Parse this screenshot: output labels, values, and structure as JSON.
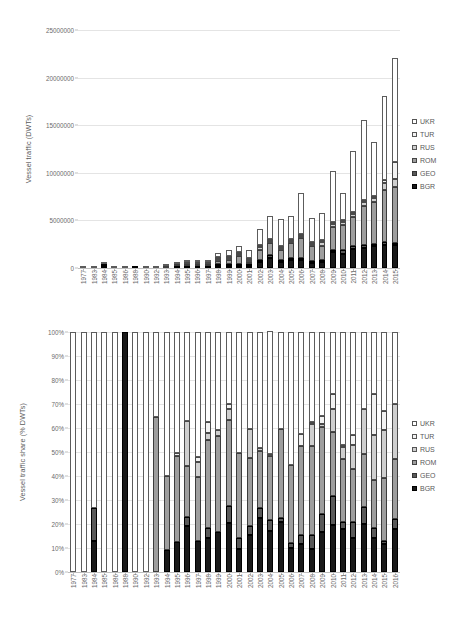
{
  "legend": {
    "position": "right",
    "entries": [
      {
        "key": "UKR",
        "label": "UKR",
        "swatch": "sw-ukr",
        "color": "#ffffff"
      },
      {
        "key": "TUR",
        "label": "TUR",
        "swatch": "sw-tur",
        "color": "#f2f2f2"
      },
      {
        "key": "RUS",
        "label": "RUS",
        "swatch": "sw-rus",
        "color": "#cfcfcf"
      },
      {
        "key": "ROM",
        "label": "ROM",
        "swatch": "sw-rom",
        "color": "#9e9e9e"
      },
      {
        "key": "GEO",
        "label": "GEO",
        "swatch": "sw-geo",
        "color": "#595959"
      },
      {
        "key": "BGR",
        "label": "BGR",
        "swatch": "sw-bgr",
        "color": "#1a1a1a"
      }
    ]
  },
  "chart_data": [
    {
      "id": "top",
      "type": "bar",
      "stacked": true,
      "title": "",
      "xlabel": "",
      "ylabel": "Vessel traffic (DWTs)",
      "ylim": [
        0,
        25000000
      ],
      "ytick_step": 5000000,
      "ytick_labels": [
        "0",
        "5000000",
        "10000000",
        "15000000",
        "20000000",
        "25000000"
      ],
      "grid": true,
      "legend_entries": [
        "UKR",
        "TUR",
        "RUS",
        "ROM",
        "GEO",
        "BGR"
      ],
      "categories": [
        "1977",
        "1983",
        "1984",
        "1985",
        "1986",
        "1988",
        "1990",
        "1992",
        "1993",
        "1994",
        "1995",
        "1996",
        "1997",
        "1998",
        "1999",
        "2000",
        "2001",
        "2002",
        "2003",
        "2004",
        "2005",
        "2006",
        "2007",
        "2008",
        "2009",
        "2010",
        "2011",
        "2012",
        "2013",
        "2014",
        "2015"
      ],
      "series": [
        {
          "name": "BGR",
          "values": [
            0,
            0,
            8000,
            0,
            0,
            12000,
            0,
            0,
            0,
            26000,
            37000,
            45000,
            36000,
            60000,
            120000,
            250000,
            90000,
            620000,
            1050000,
            620000,
            870000,
            880000,
            560000,
            650000,
            1700000,
            1450000,
            2000000,
            2150000,
            2300000,
            2450000,
            2400000
          ]
        },
        {
          "name": "GEO",
          "values": [
            0,
            0,
            16000,
            0,
            0,
            0,
            0,
            0,
            0,
            0,
            0,
            0,
            0,
            20000,
            45000,
            95000,
            35000,
            230000,
            290000,
            160000,
            180000,
            200000,
            140000,
            170000,
            230000,
            450000,
            280000,
            260000,
            270000,
            250000,
            260000
          ]
        },
        {
          "name": "ROM",
          "values": [
            0,
            0,
            0,
            0,
            0,
            0,
            0,
            0,
            95000,
            40000,
            80000,
            130000,
            55000,
            290000,
            460000,
            780000,
            130000,
            1000000,
            1250000,
            1060000,
            1530000,
            2090000,
            1570000,
            1500000,
            2340000,
            2570000,
            3050000,
            4150000,
            4400000,
            5450000,
            5900000
          ]
        },
        {
          "name": "RUS",
          "values": [
            0,
            0,
            0,
            0,
            0,
            0,
            0,
            0,
            0,
            0,
            25000,
            30000,
            20000,
            80000,
            110000,
            95000,
            25000,
            380000,
            190000,
            180000,
            220000,
            230000,
            200000,
            380000,
            400000,
            350000,
            350000,
            380000,
            420000,
            780000,
            820000
          ]
        },
        {
          "name": "TUR",
          "values": [
            0,
            0,
            0,
            0,
            0,
            0,
            0,
            0,
            0,
            0,
            0,
            0,
            0,
            40000,
            30000,
            20000,
            10000,
            60000,
            70000,
            60000,
            70000,
            100000,
            70000,
            90000,
            150000,
            140000,
            140000,
            200000,
            220000,
            300000,
            1800000
          ]
        },
        {
          "name": "UKR",
          "values": [
            14000,
            11000,
            20000,
            13000,
            14000,
            0,
            12000,
            11000,
            52000,
            38000,
            100000,
            215000,
            120000,
            420000,
            620000,
            620000,
            840000,
            1700000,
            2490000,
            2840000,
            2430000,
            4240000,
            2520000,
            2780000,
            5280000,
            2840000,
            6380000,
            8420000,
            5600000,
            8820000,
            10860000
          ]
        }
      ]
    },
    {
      "id": "bottom",
      "type": "bar",
      "stacked": true,
      "normalized": true,
      "title": "",
      "xlabel": "",
      "ylabel": "Vessel traffic share (% DWTs)",
      "ylim": [
        0,
        100
      ],
      "ytick_step": 10,
      "ytick_labels": [
        "0%",
        "10%",
        "20%",
        "30%",
        "40%",
        "50%",
        "60%",
        "70%",
        "80%",
        "90%",
        "100%"
      ],
      "grid": true,
      "legend_entries": [
        "UKR",
        "TUR",
        "RUS",
        "ROM",
        "GEO",
        "BGR"
      ],
      "categories": [
        "1977",
        "1983",
        "1984",
        "1985",
        "1986",
        "1988",
        "1990",
        "1992",
        "1993",
        "1994",
        "1995",
        "1996",
        "1997",
        "1998",
        "1999",
        "2000",
        "2001",
        "2002",
        "2003",
        "2004",
        "2005",
        "2006",
        "2007",
        "2008",
        "2009",
        "2010",
        "2011",
        "2012",
        "2013",
        "2014",
        "2015",
        "2016"
      ],
      "series": [
        {
          "name": "BGR",
          "values": [
            0,
            0,
            13,
            0,
            0,
            100,
            0,
            0,
            0,
            9,
            12.5,
            19,
            13,
            14,
            16.5,
            20.5,
            9.5,
            15.5,
            22.5,
            17,
            21,
            10,
            11.5,
            9.5,
            16.5,
            19.5,
            18,
            14,
            20,
            14,
            11.5,
            18
          ]
        },
        {
          "name": "GEO",
          "values": [
            0,
            0,
            13.5,
            0,
            0,
            0,
            0,
            0,
            0,
            0,
            0,
            4,
            0,
            4.5,
            0,
            7,
            4.5,
            3.5,
            4,
            4.5,
            1.5,
            2,
            4,
            6,
            7.5,
            12,
            3,
            7,
            7,
            4.5,
            1.5,
            4
          ]
        },
        {
          "name": "ROM",
          "values": [
            0,
            0,
            0,
            0,
            0,
            0,
            0,
            0,
            64.5,
            31,
            36,
            21,
            26.5,
            36.5,
            40,
            36,
            35.5,
            28.5,
            24,
            27,
            37,
            32.5,
            37,
            37,
            36.5,
            27,
            26,
            22,
            22,
            20,
            26,
            25
          ]
        },
        {
          "name": "RUS",
          "values": [
            0,
            0,
            0,
            0,
            0,
            0,
            0,
            0,
            0,
            0,
            0,
            19,
            6.5,
            3,
            2.5,
            4.5,
            0,
            12,
            1,
            0.5,
            0,
            0,
            0,
            9,
            1,
            9.5,
            5,
            10,
            19,
            18.5,
            20,
            23
          ]
        },
        {
          "name": "TUR",
          "values": [
            0,
            0,
            0,
            0,
            0,
            0,
            0,
            0,
            0,
            0,
            1,
            0,
            2,
            4.5,
            0,
            2,
            0,
            0,
            0,
            0,
            0,
            0,
            5,
            1,
            3.5,
            6,
            1,
            4,
            0,
            17,
            8,
            0
          ]
        },
        {
          "name": "UKR",
          "values": [
            100,
            100,
            73.5,
            100,
            100,
            0,
            100,
            100,
            35.5,
            60,
            50.5,
            37,
            52,
            37.5,
            41,
            30,
            50.5,
            40.5,
            48.5,
            51,
            40.5,
            55.5,
            42.5,
            37.5,
            35,
            26,
            47,
            43,
            32,
            26,
            33,
            30
          ]
        }
      ]
    }
  ]
}
